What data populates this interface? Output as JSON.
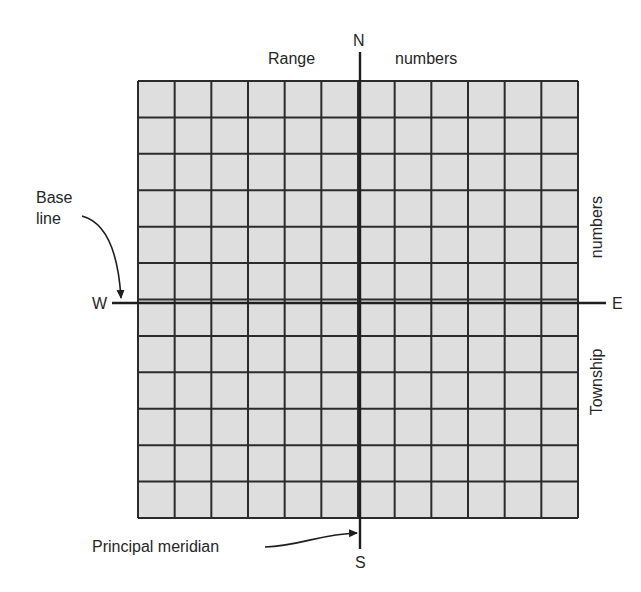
{
  "diagram": {
    "compass": {
      "north": "N",
      "south": "S",
      "east": "E",
      "west": "W"
    },
    "labels": {
      "range_left": "Range",
      "range_right": "numbers",
      "township_upper": "numbers",
      "township_lower": "Township",
      "base_line_line1": "Base",
      "base_line_line2": "line",
      "principal_meridian": "Principal meridian"
    },
    "grid": {
      "columns": 12,
      "rows": 12,
      "columns_west_of_meridian": 6,
      "columns_east_of_meridian": 6,
      "rows_north_of_base_line": 6,
      "rows_south_of_base_line": 6
    },
    "colors": {
      "cell_fill": "#dedede",
      "grid_line": "#2b2b2b",
      "axis_line": "#1e1e1e",
      "background": "#ffffff"
    }
  }
}
